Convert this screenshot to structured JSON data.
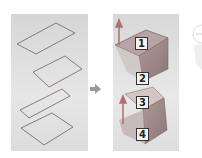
{
  "diagram": {
    "left_panel": {
      "profiles_count": 4
    },
    "arrow": {
      "direction": "right"
    },
    "right_panel": {
      "labels": [
        "1",
        "2",
        "3",
        "4"
      ]
    },
    "colors": {
      "panel_bg": "#dcdcdc",
      "profile_stroke": "#8a7a7a",
      "solid_fill": "#a08c8c",
      "arrow": "#9a9a9a",
      "axis": "#b07070"
    }
  }
}
